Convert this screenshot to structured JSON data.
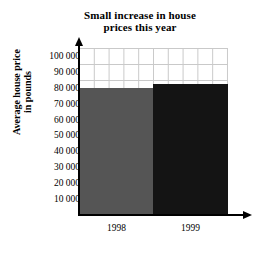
{
  "chart_data": {
    "type": "bar",
    "title": "Small increase in house prices this year",
    "title_lines": [
      "Small increase in house",
      "prices this year"
    ],
    "xlabel": "",
    "ylabel": "Average house price in pounds",
    "ylabel_lines": [
      "Average house price",
      "in pounds"
    ],
    "categories": [
      "1998",
      "1999"
    ],
    "values": [
      80000,
      82500
    ],
    "value_labels": [
      "80 000",
      "82 500"
    ],
    "ylim": [
      0,
      105000
    ],
    "ytick_values": [
      10000,
      20000,
      30000,
      40000,
      50000,
      60000,
      70000,
      80000,
      90000,
      100000
    ],
    "ytick_labels": [
      "10 000",
      "20 000",
      "30 000",
      "40 000",
      "50 000",
      "60 000",
      "70 000",
      "80 000",
      "90 000",
      "100 000"
    ],
    "bar_colors": [
      "#555555",
      "#141414"
    ],
    "grid": true,
    "grid_color": "#c9c9c9",
    "legend": null,
    "legend_position": "none",
    "axis_color": "#000000",
    "background": "#ffffff"
  }
}
